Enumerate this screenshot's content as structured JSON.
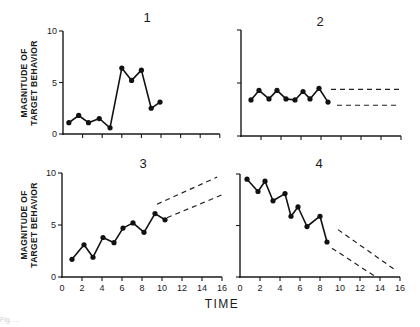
{
  "figure": {
    "xlabel": "TIME",
    "ylabel_line1": "MAGNITUDE OF",
    "ylabel_line2": "TARGET BEHAVIOR",
    "caption_fragment": "Fig. ..."
  },
  "chart_data": [
    {
      "type": "line",
      "panel": "1",
      "title": "1",
      "xlabel": "",
      "ylabel": "MAGNITUDE OF TARGET BEHAVIOR",
      "xlim": [
        0,
        16
      ],
      "ylim": [
        0,
        10
      ],
      "yticks": [
        0,
        5,
        10
      ],
      "xticks": [
        2,
        4,
        6,
        8,
        10,
        12,
        14,
        16
      ],
      "xtick_labels_shown": false,
      "x": [
        0.6,
        1.6,
        2.6,
        3.7,
        4.8,
        6.0,
        7.0,
        8.0,
        9.0,
        9.9
      ],
      "values": [
        1.1,
        1.8,
        1.1,
        1.5,
        0.6,
        6.4,
        5.2,
        6.2,
        2.5,
        3.1
      ],
      "projections": []
    },
    {
      "type": "line",
      "panel": "2",
      "title": "2",
      "xlabel": "",
      "ylabel": "",
      "xlim": [
        0,
        16
      ],
      "ylim": [
        0,
        10
      ],
      "yticks": [
        0,
        5,
        10
      ],
      "xticks": [
        2,
        4,
        6,
        8,
        10,
        12,
        14,
        16
      ],
      "xtick_labels_shown": false,
      "x": [
        1.0,
        1.8,
        2.8,
        3.6,
        4.5,
        5.4,
        6.2,
        6.9,
        7.8,
        8.7
      ],
      "values": [
        3.4,
        4.3,
        3.5,
        4.3,
        3.5,
        3.4,
        4.2,
        3.5,
        4.5,
        3.2
      ],
      "projections": [
        {
          "name": "upper",
          "from": [
            9.0,
            4.4
          ],
          "to": [
            16.0,
            4.4
          ]
        },
        {
          "name": "lower",
          "from": [
            9.6,
            2.9
          ],
          "to": [
            15.6,
            2.9
          ]
        }
      ]
    },
    {
      "type": "line",
      "panel": "3",
      "title": "3",
      "xlabel": "",
      "ylabel": "MAGNITUDE OF TARGET BEHAVIOR",
      "xlim": [
        0,
        16
      ],
      "ylim": [
        0,
        10
      ],
      "yticks": [
        0,
        5,
        10
      ],
      "xticks": [
        0,
        2,
        4,
        6,
        8,
        10,
        12,
        14,
        16
      ],
      "xtick_labels_shown": true,
      "x": [
        1.0,
        2.2,
        3.1,
        4.1,
        5.2,
        6.1,
        7.1,
        8.2,
        9.3,
        10.3
      ],
      "values": [
        1.7,
        3.1,
        1.9,
        3.8,
        3.3,
        4.7,
        5.2,
        4.3,
        6.1,
        5.5
      ],
      "projections": [
        {
          "name": "upper",
          "from": [
            9.5,
            7.0
          ],
          "to": [
            15.5,
            9.6
          ]
        },
        {
          "name": "lower",
          "from": [
            10.5,
            5.7
          ],
          "to": [
            16.0,
            7.9
          ]
        }
      ]
    },
    {
      "type": "line",
      "panel": "4",
      "title": "4",
      "xlabel": "TIME",
      "ylabel": "",
      "xlim": [
        0,
        16
      ],
      "ylim": [
        0,
        10
      ],
      "yticks": [
        0,
        5,
        10
      ],
      "xticks": [
        0,
        2,
        4,
        6,
        8,
        10,
        12,
        14,
        16
      ],
      "xtick_labels_shown": true,
      "x": [
        0.7,
        1.8,
        2.5,
        3.3,
        4.5,
        5.1,
        5.8,
        6.7,
        8.0,
        8.7
      ],
      "values": [
        9.5,
        8.3,
        9.3,
        7.4,
        8.1,
        5.9,
        6.8,
        4.9,
        5.9,
        3.4
      ],
      "projections": [
        {
          "name": "upper",
          "from": [
            9.8,
            4.6
          ],
          "to": [
            15.5,
            0.7
          ]
        },
        {
          "name": "lower",
          "from": [
            9.2,
            2.8
          ],
          "to": [
            13.6,
            0.0
          ]
        }
      ]
    }
  ],
  "ytick_labels": [
    "0",
    "5",
    "10"
  ],
  "xtick_labels": [
    "0",
    "2",
    "4",
    "6",
    "8",
    "10",
    "12",
    "14",
    "16"
  ]
}
